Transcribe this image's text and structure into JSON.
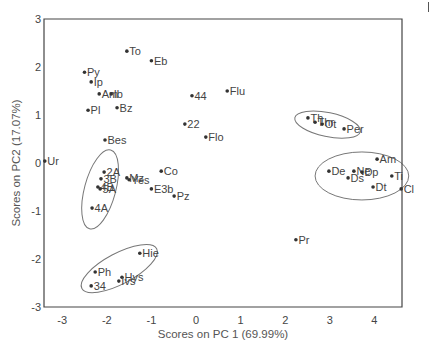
{
  "chart_data": {
    "type": "scatter",
    "title": "",
    "xlabel": "Scores on PC 1 (69.99%)",
    "ylabel": "Scores on PC2 (17.07%)",
    "xlim": [
      -3.4,
      4.62
    ],
    "ylim": [
      -3,
      3
    ],
    "xticks": [
      -3,
      -2,
      -1,
      0,
      1,
      2,
      3,
      4
    ],
    "yticks": [
      -3,
      -2,
      -1,
      0,
      1,
      2,
      3
    ],
    "grid": false,
    "legend": null,
    "points": [
      {
        "label": "Ur",
        "x": -3.39,
        "y": 0.04
      },
      {
        "label": "To",
        "x": -1.55,
        "y": 2.33
      },
      {
        "label": "Eb",
        "x": -1.0,
        "y": 2.13
      },
      {
        "label": "Py",
        "x": -2.5,
        "y": 1.89
      },
      {
        "label": "Ip",
        "x": -2.35,
        "y": 1.69
      },
      {
        "label": "Am",
        "x": -2.17,
        "y": 1.44
      },
      {
        "label": "Ib",
        "x": -1.9,
        "y": 1.44
      },
      {
        "label": "Pl",
        "x": -2.42,
        "y": 1.1
      },
      {
        "label": "Bz",
        "x": -1.77,
        "y": 1.15
      },
      {
        "label": "Bes",
        "x": -2.04,
        "y": 0.48
      },
      {
        "label": "44",
        "x": -0.09,
        "y": 1.4
      },
      {
        "label": "22",
        "x": -0.25,
        "y": 0.81
      },
      {
        "label": "Flu",
        "x": 0.7,
        "y": 1.5
      },
      {
        "label": "Flo",
        "x": 0.22,
        "y": 0.54
      },
      {
        "label": "Co",
        "x": -0.78,
        "y": -0.17
      },
      {
        "label": "2A",
        "x": -2.06,
        "y": -0.19
      },
      {
        "label": "3B",
        "x": -2.13,
        "y": -0.33
      },
      {
        "label": "4B",
        "x": -2.2,
        "y": -0.5
      },
      {
        "label": "5A",
        "x": -2.15,
        "y": -0.54
      },
      {
        "label": "Mz",
        "x": -1.55,
        "y": -0.31
      },
      {
        "label": "Yes",
        "x": -1.5,
        "y": -0.35
      },
      {
        "label": "E3b",
        "x": -1.0,
        "y": -0.54
      },
      {
        "label": "Pz",
        "x": -0.49,
        "y": -0.69
      },
      {
        "label": "4A",
        "x": -2.33,
        "y": -0.94
      },
      {
        "label": "Hie",
        "x": -1.26,
        "y": -1.88
      },
      {
        "label": "Ph",
        "x": -2.26,
        "y": -2.27
      },
      {
        "label": "Hys",
        "x": -1.66,
        "y": -2.38
      },
      {
        "label": "Ivs",
        "x": -1.73,
        "y": -2.46
      },
      {
        "label": "34",
        "x": -2.35,
        "y": -2.56
      },
      {
        "label": "Pr",
        "x": 2.24,
        "y": -1.6
      },
      {
        "label": "Th",
        "x": 2.51,
        "y": 0.94
      },
      {
        "label": "Thr",
        "x": 2.67,
        "y": 0.85
      },
      {
        "label": "Ot",
        "x": 2.83,
        "y": 0.81
      },
      {
        "label": "Per",
        "x": 3.32,
        "y": 0.71
      },
      {
        "label": "Am",
        "x": 4.06,
        "y": 0.08
      },
      {
        "label": "De",
        "x": 2.98,
        "y": -0.17
      },
      {
        "label": "Ne",
        "x": 3.54,
        "y": -0.17
      },
      {
        "label": "Dp",
        "x": 3.72,
        "y": -0.19
      },
      {
        "label": "Ds",
        "x": 3.41,
        "y": -0.31
      },
      {
        "label": "Ti",
        "x": 4.39,
        "y": -0.27
      },
      {
        "label": "Dt",
        "x": 3.97,
        "y": -0.5
      },
      {
        "label": "Cl",
        "x": 4.6,
        "y": -0.54
      }
    ],
    "annotations": [
      {
        "type": "ellipse",
        "cx": -2.15,
        "cy": -0.55,
        "rx": 0.35,
        "ry": 0.85,
        "rotate_deg": 15,
        "note": "group 2A/3B/4B/5A/4A"
      },
      {
        "type": "ellipse",
        "cx": -1.72,
        "cy": -2.2,
        "rx": 0.95,
        "ry": 0.32,
        "rotate_deg": -28,
        "note": "group Hie/Ph/Hys/Ivs/34"
      },
      {
        "type": "ellipse",
        "cx": 2.95,
        "cy": 0.8,
        "rx": 0.75,
        "ry": 0.25,
        "rotate_deg": 12,
        "note": "group Th/Thr/Ot/Per"
      },
      {
        "type": "ellipse",
        "cx": 3.72,
        "cy": -0.27,
        "rx": 1.05,
        "ry": 0.5,
        "rotate_deg": 0,
        "note": "group Am/De/Ne/Dp/Ds/Ti/Dt/Cl"
      }
    ]
  },
  "colors": {
    "axis": "#444444",
    "point": "#333333",
    "text": "#444444",
    "ellipse": "#777777"
  }
}
